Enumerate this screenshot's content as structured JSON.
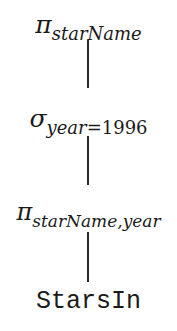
{
  "diagram": {
    "type": "relational-algebra-tree",
    "nodes": [
      {
        "id": "n1",
        "operator": "π",
        "operator_name": "projection",
        "subscript": "starName"
      },
      {
        "id": "n2",
        "operator": "σ",
        "operator_name": "selection",
        "subscript_var": "year",
        "subscript_op": "=",
        "subscript_val": "1996"
      },
      {
        "id": "n3",
        "operator": "π",
        "operator_name": "projection",
        "subscript": "starName,year"
      },
      {
        "id": "n4",
        "relation": "StarsIn"
      }
    ],
    "edges": [
      {
        "from": "n1",
        "to": "n2"
      },
      {
        "from": "n2",
        "to": "n3"
      },
      {
        "from": "n3",
        "to": "n4"
      }
    ]
  }
}
